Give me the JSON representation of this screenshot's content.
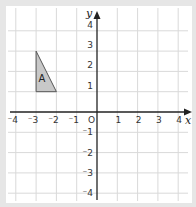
{
  "diagram": {
    "type": "coordinate-grid",
    "x_axis": {
      "label": "x",
      "min": -4,
      "max": 4,
      "ticks": [
        "⁻4",
        "⁻3",
        "⁻2",
        "⁻1",
        "1",
        "2",
        "3",
        "4"
      ]
    },
    "y_axis": {
      "label": "y",
      "min": -4,
      "max": 4,
      "ticks": [
        "4",
        "3",
        "2",
        "1",
        "⁻1",
        "⁻2",
        "⁻3",
        "⁻4"
      ]
    },
    "origin_label": "O",
    "shapes": [
      {
        "label": "A",
        "type": "triangle",
        "vertices": [
          [
            -3,
            3
          ],
          [
            -3,
            1
          ],
          [
            -2,
            1
          ]
        ],
        "fill": "#c8c8c8",
        "stroke": "#555555"
      }
    ],
    "colors": {
      "grid": "#d9d9d9",
      "axis": "#222222",
      "frame": "#e6e6e6",
      "background": "#ffffff"
    }
  }
}
